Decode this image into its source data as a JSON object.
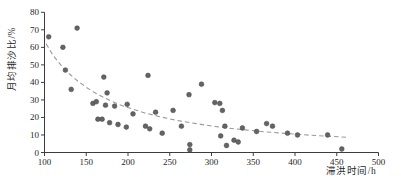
{
  "chart_data": {
    "type": "scatter",
    "title": "",
    "xlabel": "滞洪时间/h",
    "ylabel": "月均排沙比/%",
    "xlim": [
      100,
      500
    ],
    "ylim": [
      0,
      80
    ],
    "x_ticks": [
      100,
      150,
      200,
      250,
      300,
      350,
      400,
      450,
      500
    ],
    "y_ticks": [
      0,
      10,
      20,
      30,
      40,
      50,
      60,
      70,
      80
    ],
    "grid": false,
    "legend_position": "none",
    "axis_color": "#3d3d3d",
    "series": [
      {
        "name": "月均排沙比观测点",
        "type": "scatter",
        "marker": "circle",
        "color": "#646464",
        "points": [
          [
            105,
            66
          ],
          [
            122,
            60
          ],
          [
            139,
            71
          ],
          [
            125,
            47
          ],
          [
            132,
            36
          ],
          [
            171,
            43
          ],
          [
            224,
            44
          ],
          [
            288,
            39
          ],
          [
            175,
            34
          ],
          [
            273,
            33
          ],
          [
            158,
            28
          ],
          [
            162,
            29
          ],
          [
            173,
            27
          ],
          [
            184,
            26.5
          ],
          [
            199,
            27.5
          ],
          [
            206,
            22
          ],
          [
            233,
            23
          ],
          [
            254,
            24
          ],
          [
            164,
            19
          ],
          [
            169,
            19
          ],
          [
            178,
            17
          ],
          [
            188,
            16
          ],
          [
            198,
            14.5
          ],
          [
            221,
            15
          ],
          [
            226,
            13.5
          ],
          [
            241,
            11
          ],
          [
            264,
            15
          ],
          [
            274,
            4.5
          ],
          [
            274,
            1.5
          ],
          [
            304,
            28.5
          ],
          [
            310,
            28
          ],
          [
            313,
            24
          ],
          [
            316,
            15
          ],
          [
            311,
            9.5
          ],
          [
            327,
            7
          ],
          [
            332,
            6
          ],
          [
            318,
            4
          ],
          [
            337,
            14
          ],
          [
            354,
            12
          ],
          [
            366,
            16.5
          ],
          [
            373,
            15
          ],
          [
            391,
            11
          ],
          [
            403,
            10
          ],
          [
            439,
            10
          ],
          [
            456,
            2
          ]
        ]
      },
      {
        "name": "趋势线",
        "type": "line",
        "style": "dashed",
        "color": "#9a9a9a",
        "points": [
          [
            102,
            62
          ],
          [
            110,
            55.5
          ],
          [
            120,
            49.7
          ],
          [
            130,
            44.8
          ],
          [
            140,
            40.7
          ],
          [
            150,
            37.2
          ],
          [
            160,
            34.2
          ],
          [
            170,
            31.6
          ],
          [
            180,
            29.3
          ],
          [
            190,
            27.3
          ],
          [
            200,
            25.6
          ],
          [
            220,
            22.6
          ],
          [
            240,
            20.2
          ],
          [
            260,
            18.2
          ],
          [
            280,
            16.6
          ],
          [
            300,
            15.1
          ],
          [
            320,
            13.9
          ],
          [
            340,
            12.9
          ],
          [
            360,
            12.0
          ],
          [
            380,
            11.2
          ],
          [
            400,
            10.5
          ],
          [
            420,
            9.8
          ],
          [
            440,
            9.3
          ],
          [
            462,
            8.7
          ]
        ]
      }
    ]
  }
}
